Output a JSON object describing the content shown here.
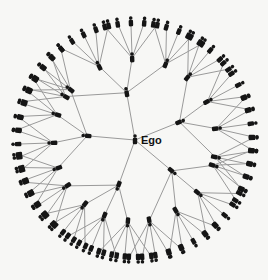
{
  "ego": {
    "label": "Ego",
    "x": 135,
    "y": 140
  },
  "colors": {
    "edge": "#9a9a9a",
    "node": "#151515",
    "background": "#f7f7f5"
  },
  "radii": {
    "level1": 48,
    "level2": 82,
    "level3": 118
  },
  "branches": [
    {
      "angle": -100,
      "children": [
        -148,
        -116,
        -92,
        -68
      ],
      "leaves": 5,
      "spread": 6.5
    },
    {
      "angle": -22,
      "children": [
        -50,
        -28,
        -8,
        12
      ],
      "leaves": 5,
      "spread": 6.5
    },
    {
      "angle": 40,
      "children": [
        18,
        40,
        60,
        80
      ],
      "leaves": 5,
      "spread": 6.5
    },
    {
      "angle": 110,
      "children": [
        95,
        112,
        128,
        146
      ],
      "leaves": 5,
      "spread": 6.5
    },
    {
      "angle": 185,
      "children": [
        160,
        178,
        198,
        218
      ],
      "leaves": 5,
      "spread": 6.5
    }
  ]
}
